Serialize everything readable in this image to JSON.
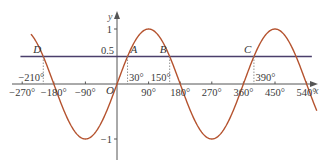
{
  "chart_data": {
    "type": "line",
    "title": "",
    "xlabel": "x",
    "ylabel": "y",
    "origin_label": "O",
    "xlim": [
      -270,
      570
    ],
    "ylim": [
      -1.3,
      1.3
    ],
    "grid": false,
    "legend": null,
    "series": [
      {
        "name": "y = sin x",
        "function": "sin(x)",
        "x_range": [
          -245,
          570
        ],
        "color": "#b5532f"
      },
      {
        "name": "y = 0.5",
        "function": "0.5",
        "x_range": [
          -275,
          555
        ],
        "color": "#4a3f6b"
      }
    ],
    "x_ticks": [
      {
        "value": -270,
        "label": "−270°"
      },
      {
        "value": -180,
        "label": "−180°"
      },
      {
        "value": -90,
        "label": "−90°"
      },
      {
        "value": 90,
        "label": "90°"
      },
      {
        "value": 180,
        "label": "180°"
      },
      {
        "value": 270,
        "label": "270°"
      },
      {
        "value": 360,
        "label": "360°"
      },
      {
        "value": 450,
        "label": "450°"
      },
      {
        "value": 540,
        "label": "540°"
      }
    ],
    "y_ticks": [
      {
        "value": 1,
        "label": "1"
      },
      {
        "value": 0.5,
        "label": "0.5"
      },
      {
        "value": -1,
        "label": "−1"
      }
    ],
    "intersection_points": [
      {
        "name": "D",
        "x": -210,
        "y": 0.5,
        "x_label": "−210°"
      },
      {
        "name": "A",
        "x": 30,
        "y": 0.5,
        "x_label": "30°"
      },
      {
        "name": "B",
        "x": 150,
        "y": 0.5,
        "x_label": "150°"
      },
      {
        "name": "C",
        "x": 390,
        "y": 0.5,
        "x_label": "390°"
      }
    ]
  }
}
